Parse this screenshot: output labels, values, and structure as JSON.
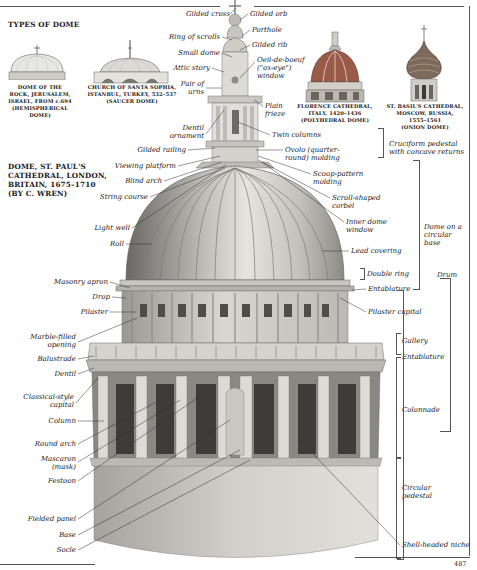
{
  "page": {
    "number": "487",
    "section_title": "TYPES OF DOME",
    "main_title": [
      "DOME, ST. PAUL'S",
      "CATHEDRAL, LONDON,",
      "BRITAIN, 1675–1710",
      "(BY C. WREN)"
    ]
  },
  "dome_types": [
    {
      "name": "dome-of-the-rock",
      "caption": [
        "DOME OF THE",
        "ROCK, JERUSALEM,",
        "ISRAEL, FROM c.694",
        "(HEMISPHERICAL",
        "DOME)"
      ]
    },
    {
      "name": "santa-sophia",
      "caption": [
        "CHURCH OF SANTA SOPHIA,",
        "ISTANBUL, TURKEY, 532–537",
        "(SAUCER DOME)"
      ]
    },
    {
      "name": "florence-cathedral",
      "caption": [
        "FLORENCE CATHEDRAL,",
        "ITALY, 1420–1436",
        "(POLYHEDRAL DOME)"
      ]
    },
    {
      "name": "st-basils",
      "caption": [
        "ST. BASIL'S CATHEDRAL,",
        "MOSCOW, RUSSIA,",
        "1555–1561",
        "(ONION DOME)"
      ]
    }
  ],
  "labels_left": {
    "gilded_cross": "Gilded cross",
    "ring_of_scrolls": "Ring of scrolls",
    "small_dome": "Small dome",
    "attic_story": "Attic story",
    "pair_of_urns": [
      "Pair of",
      "urns"
    ],
    "dentil_ornament": [
      "Dentil",
      "ornament"
    ],
    "gilded_railing": "Gilded railing",
    "viewing_platform": "Viewing platform",
    "blind_arch": "Blind arch",
    "string_course": "String course",
    "light_well": "Light well",
    "roll": "Roll",
    "masonry_apron": "Masonry apron",
    "drop": "Drop",
    "pilaster": "Pilaster",
    "marble_filled_opening": [
      "Marble-filled",
      "opening"
    ],
    "balustrade": "Balustrade",
    "dentil": "Dentil",
    "classical_capital": [
      "Classical-style",
      "capital"
    ],
    "column": "Column",
    "round_arch": "Round arch",
    "mascaron": [
      "Mascaron",
      "(mask)"
    ],
    "festoon": "Festoon",
    "fielded_panel": "Fielded panel",
    "base": "Base",
    "socle": "Socle"
  },
  "labels_right": {
    "gilded_orb": "Gilded orb",
    "porthole": "Porthole",
    "gilded_rib": "Gilded rib",
    "oeil_de_boeuf": [
      "Oeil-de-boeuf",
      "(\"ox-eye\")",
      "window"
    ],
    "plain_frieze": [
      "Plain",
      "frieze"
    ],
    "twin_columns": "Twin columns",
    "ovolo": [
      "Ovolo (quarter-",
      "round) molding"
    ],
    "scoop_pattern": [
      "Scoop-pattern",
      "molding"
    ],
    "scroll_corbel": [
      "Scroll-shaped",
      "corbel"
    ],
    "inner_dome_window": [
      "Inner dome",
      "window"
    ],
    "lead_covering": "Lead covering",
    "double_ring": "Double ring",
    "entablature_upper": "Entablature",
    "pilaster_capital": "Pilaster capital",
    "gallery": "Gallery",
    "entablature_lower": "Entablature",
    "colonnade": "Colonnade",
    "circular_pedestal": [
      "Circular",
      "pedestal"
    ],
    "shell_headed_niche": "Shell-headed niche"
  },
  "brackets": {
    "cruciform_pedestal": [
      "Cruciform pedestal",
      "with concave returns"
    ],
    "dome_on_base": [
      "Dome on a",
      "circular",
      "base"
    ],
    "drum": "Drum"
  },
  "colors": {
    "ink": "#222222",
    "stone_light": "#d8d6d0",
    "stone_mid": "#a9a7a2",
    "stone_dark": "#5e5c58",
    "florence_red": "#9a5a48",
    "onion_top": "#7d6a5c"
  }
}
